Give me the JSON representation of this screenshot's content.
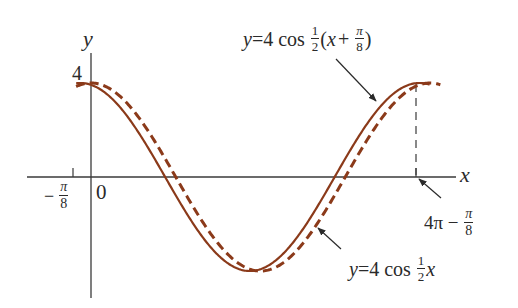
{
  "chart_data": {
    "type": "line",
    "title": "",
    "xlabel": "x",
    "ylabel": "y",
    "origin_label": "0",
    "y_tick_label": "4",
    "x_tick_labels": [
      "-π/8",
      "4π - π/8"
    ],
    "xlim": [
      -0.55,
      13.0
    ],
    "ylim": [
      -4.8,
      5.3
    ],
    "grid": false,
    "legend": "none (curves labeled with arrows)",
    "series": [
      {
        "name": "y = 4 cos ½(x + π/8)",
        "style": "solid",
        "color": "#8B3A1A",
        "formula": "4*cos(0.5*(x+pi/8))",
        "x_range": [
          -0.55,
          12.55
        ],
        "key_points": [
          {
            "x": -0.3927,
            "y": 4
          },
          {
            "x": 2.7489,
            "y": 0
          },
          {
            "x": 5.8905,
            "y": -4
          },
          {
            "x": 9.0321,
            "y": 0
          },
          {
            "x": 12.1737,
            "y": 4
          }
        ]
      },
      {
        "name": "y = 4 cos ½x",
        "style": "dashed",
        "color": "#8B3A1A",
        "formula": "4*cos(0.5*x)",
        "x_range": [
          -0.55,
          12.95
        ],
        "key_points": [
          {
            "x": 0,
            "y": 4
          },
          {
            "x": 3.1416,
            "y": 0
          },
          {
            "x": 6.2832,
            "y": -4
          },
          {
            "x": 9.4248,
            "y": 0
          },
          {
            "x": 12.5664,
            "y": 4
          }
        ]
      }
    ],
    "annotations": [
      {
        "text": "y = 4 cos ½(x + π/8)",
        "points_to": "solid curve (rising section)"
      },
      {
        "text": "y = 4 cos ½x",
        "points_to": "dashed curve (rising section)"
      },
      {
        "text": "4π - π/8",
        "points_to": "x-axis at second peak of solid curve"
      },
      {
        "text": "dashed vertical line",
        "at_x": "4π - π/8"
      }
    ]
  },
  "labels": {
    "y_axis": "y",
    "x_axis": "x",
    "origin": "0",
    "y_four": "4",
    "neg_sign": "−",
    "pi": "π",
    "eight": "8",
    "one": "1",
    "two": "2",
    "shifted_eq": {
      "lhs": "y",
      "eq": "=4 cos ",
      "open": "(",
      "x": "x",
      "plus": "+ ",
      "close": ")"
    },
    "base_eq": {
      "lhs": "y",
      "eq": "=4 cos ",
      "x": "x"
    },
    "period_mark": {
      "four_pi": "4π",
      "minus": " − "
    }
  }
}
